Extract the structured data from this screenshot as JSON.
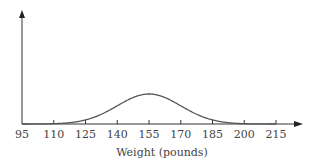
{
  "chart_data": {
    "type": "line",
    "title": "",
    "xlabel": "Weight (pounds)",
    "ylabel": "",
    "x_ticks": [
      95,
      110,
      125,
      140,
      155,
      170,
      185,
      200,
      215
    ],
    "xlim": [
      95,
      215
    ],
    "distribution": "normal",
    "mean": 155,
    "std_dev": 15,
    "grid": false,
    "legend": null,
    "colors": {
      "axis": "#333333",
      "curve": "#555555",
      "text": "#444444"
    }
  }
}
